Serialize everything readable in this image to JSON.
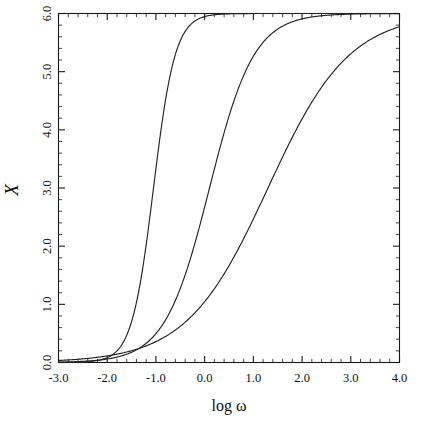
{
  "chart_data": {
    "type": "line",
    "title": "",
    "subtitle": "",
    "xlabel": "log ω",
    "ylabel": "X",
    "xlim": [
      -3.0,
      4.0
    ],
    "ylim": [
      0.0,
      6.0
    ],
    "xticks": [
      "-3.0",
      "-2.0",
      "-1.0",
      "0.0",
      "1.0",
      "2.0",
      "3.0",
      "4.0"
    ],
    "xtick_values": [
      -3.0,
      -2.0,
      -1.0,
      0.0,
      1.0,
      2.0,
      3.0,
      4.0
    ],
    "yticks": [
      "0.0",
      "1.0",
      "2.0",
      "3.0",
      "4.0",
      "5.0",
      "6.0"
    ],
    "ytick_values": [
      0.0,
      1.0,
      2.0,
      3.0,
      4.0,
      5.0,
      6.0
    ],
    "minor_tick_interval_x": 0.2,
    "minor_tick_interval_y": 0.2,
    "grid": false,
    "legend": "none",
    "frame": "box",
    "saturation_value": 6.0,
    "series": [
      {
        "name": "steep",
        "color": "#232323",
        "midpoint": -1.05,
        "slope": 1.95,
        "x": [
          -3.0,
          -2.8,
          -2.6,
          -2.4,
          -2.2,
          -2.0,
          -1.8,
          -1.6,
          -1.4,
          -1.2,
          -1.0,
          -0.8,
          -0.6,
          -0.4,
          -0.2,
          0.0,
          0.5,
          1.0,
          1.5,
          2.0,
          2.5,
          3.0,
          3.5,
          4.0
        ],
        "y": [
          0.02,
          0.03,
          0.05,
          0.07,
          0.11,
          0.17,
          0.27,
          0.45,
          0.8,
          1.55,
          3.0,
          4.55,
          5.35,
          5.72,
          5.87,
          5.93,
          5.98,
          6.0,
          6.0,
          6.0,
          6.0,
          6.0,
          6.0,
          6.0
        ]
      },
      {
        "name": "medium",
        "color": "#232323",
        "midpoint": 0.1,
        "slope": 0.95,
        "x": [
          -3.0,
          -2.8,
          -2.6,
          -2.4,
          -2.2,
          -2.0,
          -1.8,
          -1.6,
          -1.4,
          -1.2,
          -1.0,
          -0.8,
          -0.6,
          -0.4,
          -0.2,
          0.0,
          0.2,
          0.4,
          0.6,
          0.8,
          1.0,
          1.2,
          1.5,
          2.0,
          2.5,
          3.0,
          3.5,
          4.0
        ],
        "y": [
          0.02,
          0.03,
          0.04,
          0.06,
          0.09,
          0.14,
          0.21,
          0.31,
          0.46,
          0.68,
          1.0,
          1.42,
          1.95,
          2.55,
          3.18,
          3.75,
          4.28,
          4.72,
          5.08,
          5.35,
          5.55,
          5.69,
          5.83,
          5.93,
          5.97,
          5.99,
          6.0,
          6.0
        ]
      },
      {
        "name": "shallow",
        "color": "#232323",
        "midpoint": 1.3,
        "slope": 0.52,
        "x": [
          -3.0,
          -2.8,
          -2.6,
          -2.4,
          -2.2,
          -2.0,
          -1.8,
          -1.6,
          -1.4,
          -1.2,
          -1.0,
          -0.8,
          -0.6,
          -0.4,
          -0.2,
          0.0,
          0.4,
          0.8,
          1.2,
          1.6,
          2.0,
          2.4,
          2.8,
          3.2,
          3.6,
          4.0
        ],
        "y": [
          0.02,
          0.03,
          0.04,
          0.05,
          0.07,
          0.11,
          0.16,
          0.24,
          0.34,
          0.48,
          0.66,
          0.9,
          1.18,
          1.5,
          1.85,
          2.2,
          2.9,
          3.58,
          4.2,
          4.72,
          5.12,
          5.43,
          5.63,
          5.77,
          5.85,
          5.91
        ]
      }
    ]
  },
  "axes": {
    "x_title": "log ω",
    "y_title": "X"
  },
  "colors": {
    "curve": "#232323",
    "axis": "#1a1a1a",
    "background": "#ffffff",
    "text": "#111111"
  }
}
